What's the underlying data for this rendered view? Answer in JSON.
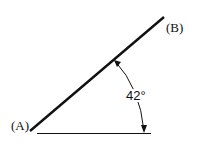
{
  "diagram": {
    "point_a_label": "(A)",
    "point_b_label": "(B)",
    "angle_label": "42°",
    "angle_degrees": 42,
    "line_color": "#111111"
  }
}
